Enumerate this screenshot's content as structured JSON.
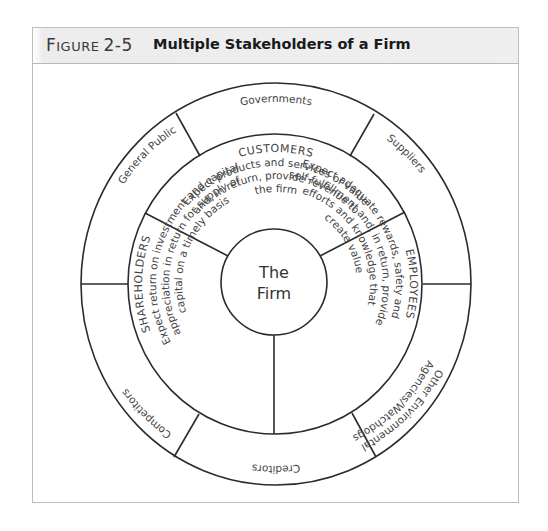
{
  "figure": {
    "label_first": "F",
    "label_rest": "IGURE",
    "number": "2-5",
    "title": "Multiple Stakeholders of a Firm"
  },
  "center": {
    "line1": "The",
    "line2": "Firm"
  },
  "outer_ring": {
    "segments": [
      {
        "label": "Governments"
      },
      {
        "label": "Suppliers"
      },
      {
        "label_line1": "Other Environmental",
        "label_line2": "Agencies/Watchdogs"
      },
      {
        "label": "Creditors"
      },
      {
        "label": "Competitors"
      },
      {
        "label": "General Public"
      }
    ]
  },
  "middle_ring": {
    "customers": {
      "heading": "CUSTOMERS",
      "lines": [
        "Expect products and services of value",
        "and, in return, provide revenue to",
        "the firm"
      ]
    },
    "employees": {
      "heading": "EMPLOYEES",
      "lines": [
        "Expect adequate rewards, safety and",
        "self-fulfillment and, in return, provide",
        "efforts and knowledge that",
        "create value"
      ]
    },
    "shareholders": {
      "heading": "SHAREHOLDERS",
      "lines": [
        "Expect return on investment and capital",
        "appreciation in return for supply of",
        "capital on a timely basis"
      ]
    }
  },
  "colors": {
    "stroke": "#2b2b2b",
    "text": "#444444",
    "header_bg": "#efefef",
    "frame_border": "#bdbdbd"
  }
}
